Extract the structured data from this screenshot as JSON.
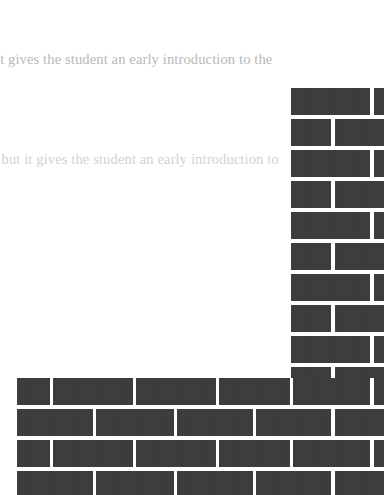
{
  "page": {
    "background_color": "#ffffff",
    "width": 384,
    "height": 495
  },
  "text_lines": [
    {
      "id": "line-1",
      "text": "it gives the student an early introduction to the",
      "color": "#b9b9bb",
      "truncated_left": true
    },
    {
      "id": "line-2",
      "text": ", but it gives the student an early introduction to",
      "color": "#d2d2d4",
      "truncated_left": true
    }
  ],
  "wall": {
    "brick_color": "#3b3b3d",
    "mortar_color": "#ffffff",
    "description": "brick-wall-inverted-L",
    "column": {
      "description": "vertical-brick-column-right-edge",
      "top": 88,
      "left": 291,
      "row_height": 27,
      "row_pitch": 31,
      "rows": 10
    },
    "band": {
      "description": "horizontal-brick-band-bottom",
      "top": 378,
      "left": 17,
      "row_height": 27,
      "row_pitch": 31,
      "rows": 4
    },
    "column_bricks": [
      {
        "x": 291,
        "y": 88,
        "w": 79,
        "h": 27
      },
      {
        "x": 374,
        "y": 88,
        "w": 10,
        "h": 27
      },
      {
        "x": 291,
        "y": 119,
        "w": 40,
        "h": 27
      },
      {
        "x": 335,
        "y": 119,
        "w": 49,
        "h": 27
      },
      {
        "x": 291,
        "y": 150,
        "w": 79,
        "h": 27
      },
      {
        "x": 374,
        "y": 150,
        "w": 10,
        "h": 27
      },
      {
        "x": 291,
        "y": 181,
        "w": 40,
        "h": 27
      },
      {
        "x": 335,
        "y": 181,
        "w": 49,
        "h": 27
      },
      {
        "x": 291,
        "y": 212,
        "w": 79,
        "h": 27
      },
      {
        "x": 374,
        "y": 212,
        "w": 10,
        "h": 27
      },
      {
        "x": 291,
        "y": 243,
        "w": 40,
        "h": 27
      },
      {
        "x": 335,
        "y": 243,
        "w": 49,
        "h": 27
      },
      {
        "x": 291,
        "y": 274,
        "w": 79,
        "h": 27
      },
      {
        "x": 374,
        "y": 274,
        "w": 10,
        "h": 27
      },
      {
        "x": 291,
        "y": 305,
        "w": 40,
        "h": 27
      },
      {
        "x": 335,
        "y": 305,
        "w": 49,
        "h": 27
      },
      {
        "x": 291,
        "y": 336,
        "w": 79,
        "h": 27
      },
      {
        "x": 374,
        "y": 336,
        "w": 10,
        "h": 27
      },
      {
        "x": 291,
        "y": 367,
        "w": 40,
        "h": 11
      },
      {
        "x": 335,
        "y": 367,
        "w": 49,
        "h": 11
      }
    ],
    "band_bricks": [
      {
        "x": 17,
        "y": 378,
        "w": 33,
        "h": 27
      },
      {
        "x": 53,
        "y": 378,
        "w": 80,
        "h": 27
      },
      {
        "x": 136,
        "y": 378,
        "w": 80,
        "h": 27
      },
      {
        "x": 219,
        "y": 378,
        "w": 71,
        "h": 27
      },
      {
        "x": 293,
        "y": 378,
        "w": 77,
        "h": 27
      },
      {
        "x": 374,
        "y": 378,
        "w": 10,
        "h": 27
      },
      {
        "x": 17,
        "y": 409,
        "w": 76,
        "h": 27
      },
      {
        "x": 96,
        "y": 409,
        "w": 78,
        "h": 27
      },
      {
        "x": 177,
        "y": 409,
        "w": 76,
        "h": 27
      },
      {
        "x": 256,
        "y": 409,
        "w": 75,
        "h": 27
      },
      {
        "x": 335,
        "y": 409,
        "w": 49,
        "h": 27
      },
      {
        "x": 17,
        "y": 440,
        "w": 33,
        "h": 27
      },
      {
        "x": 53,
        "y": 440,
        "w": 80,
        "h": 27
      },
      {
        "x": 136,
        "y": 440,
        "w": 80,
        "h": 27
      },
      {
        "x": 219,
        "y": 440,
        "w": 71,
        "h": 27
      },
      {
        "x": 293,
        "y": 440,
        "w": 77,
        "h": 27
      },
      {
        "x": 374,
        "y": 440,
        "w": 10,
        "h": 27
      },
      {
        "x": 17,
        "y": 471,
        "w": 76,
        "h": 24
      },
      {
        "x": 96,
        "y": 471,
        "w": 78,
        "h": 24
      },
      {
        "x": 177,
        "y": 471,
        "w": 76,
        "h": 24
      },
      {
        "x": 256,
        "y": 471,
        "w": 75,
        "h": 24
      },
      {
        "x": 335,
        "y": 471,
        "w": 49,
        "h": 24
      }
    ]
  }
}
